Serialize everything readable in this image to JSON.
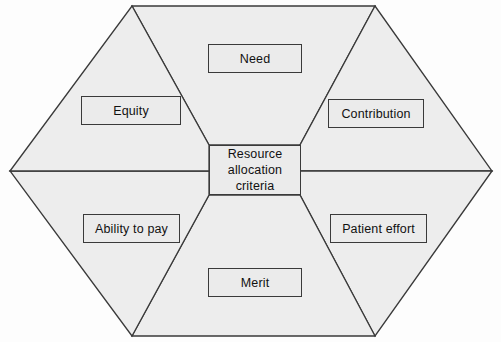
{
  "diagram": {
    "title": "Resource allocation criteria",
    "type": "hexagon-sector-diagram",
    "colors": {
      "page_background": "#fdfdfd",
      "sector_fill": "#ededed",
      "box_fill": "#ebebeb",
      "stroke": "#3a3a3a",
      "text": "#111111"
    },
    "center": {
      "label": "Resource\nallocation\ncriteria",
      "line1": "Resource",
      "line2": "allocation",
      "line3": "criteria"
    },
    "sectors": [
      {
        "id": "need",
        "label": "Need",
        "position": "top"
      },
      {
        "id": "contribution",
        "label": "Contribution",
        "position": "upper-right"
      },
      {
        "id": "patient-effort",
        "label": "Patient effort",
        "position": "lower-right"
      },
      {
        "id": "merit",
        "label": "Merit",
        "position": "bottom"
      },
      {
        "id": "ability-to-pay",
        "label": "Ability to pay",
        "position": "lower-left"
      },
      {
        "id": "equity",
        "label": "Equity",
        "position": "upper-left"
      }
    ]
  }
}
